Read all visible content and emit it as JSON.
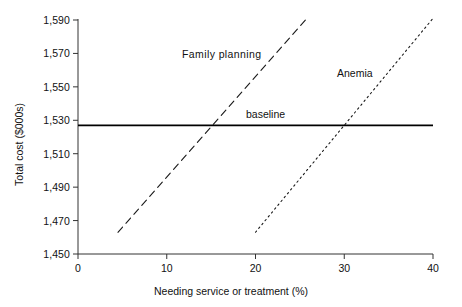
{
  "chart_data": {
    "type": "line",
    "title": "",
    "subtitle": "",
    "xlabel": "Needing service or treatment (%)",
    "ylabel": "Total cost ($000s)",
    "xlim": [
      0,
      40
    ],
    "ylim": [
      1450,
      1590
    ],
    "xticks": [
      0,
      10,
      20,
      30,
      40
    ],
    "xtick_labels": [
      "0",
      "10",
      "20",
      "30",
      "40"
    ],
    "yticks": [
      1450,
      1470,
      1490,
      1510,
      1530,
      1550,
      1570,
      1590
    ],
    "ytick_labels": [
      "1,450",
      "1,470",
      "1,490",
      "1,510",
      "1,530",
      "1,550",
      "1,570",
      "1,590"
    ],
    "grid": false,
    "legend": "none",
    "annotations": [
      {
        "name": "family-planning",
        "text": "Family  planning",
        "x": 11.7,
        "y": 1561
      },
      {
        "name": "anemia",
        "text": "Anemia",
        "x": 29.2,
        "y": 1550
      },
      {
        "name": "baseline",
        "text": "baseline",
        "x": 18.9,
        "y": 1534
      }
    ],
    "series": [
      {
        "name": "baseline",
        "label": "baseline",
        "style": "solid",
        "color": "#000000",
        "width": 1.8,
        "x": [
          0,
          40
        ],
        "values": [
          1527,
          1527
        ]
      },
      {
        "name": "family-planning",
        "label": "Family  planning",
        "style": "dashed",
        "color": "#1a1a1a",
        "width": 1.1,
        "x": [
          4.5,
          25.8
        ],
        "values": [
          1463,
          1591
        ]
      },
      {
        "name": "anemia",
        "label": "Anemia",
        "style": "dotted",
        "color": "#1a1a1a",
        "width": 1.1,
        "x": [
          20.0,
          40.0
        ],
        "values": [
          1463,
          1591
        ]
      }
    ]
  }
}
